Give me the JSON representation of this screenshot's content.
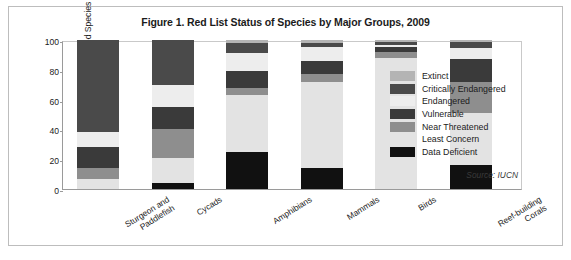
{
  "figure": {
    "title": "Figure 1. Red List Status of Species by Major Groups, 2009",
    "source": "Source: IUCN"
  },
  "axes": {
    "ylabel": "Percent of Evaluated Species",
    "yticks": [
      "100",
      "80",
      "60",
      "40",
      "20",
      "0"
    ]
  },
  "legend": {
    "items": [
      {
        "label": "Extinct",
        "color": "#b4b4b4"
      },
      {
        "label": "Critically Endangered",
        "color": "#4a4a4a"
      },
      {
        "label": "Endangered",
        "color": "#ededed"
      },
      {
        "label": "Vulnerable",
        "color": "#3a3a3a"
      },
      {
        "label": "Near Threatened",
        "color": "#8e8e8e"
      },
      {
        "label": "Least Concern",
        "color": "#e3e3e3"
      },
      {
        "label": "Data Deficient",
        "color": "#111111"
      }
    ]
  },
  "chart_data": {
    "type": "bar",
    "subtype": "stacked-bar-100-percent",
    "title": "Figure 1. Red List Status of Species by Major Groups, 2009",
    "xlabel": "",
    "ylabel": "Percent of Evaluated Species",
    "ylim": [
      0,
      100
    ],
    "ytick_step": 20,
    "grid": false,
    "legend_position": "right",
    "source": "Source: IUCN",
    "categories": [
      "Sturgeon and Paddlefish",
      "Cycads",
      "Amphibians",
      "Mammals",
      "Birds",
      "Reef-building Corals"
    ],
    "category_lines": [
      [
        "Sturgeon and",
        "Paddlefish"
      ],
      [
        "Cycads"
      ],
      [
        "Amphibians"
      ],
      [
        "Mammals"
      ],
      [
        "Birds"
      ],
      [
        "Reef-building",
        "Corals"
      ]
    ],
    "series": [
      {
        "name": "Data Deficient",
        "color": "#111111",
        "values": [
          0,
          4,
          25,
          14,
          0,
          16
        ]
      },
      {
        "name": "Least Concern",
        "color": "#e3e3e3",
        "values": [
          7,
          17,
          38,
          58,
          88,
          35
        ]
      },
      {
        "name": "Near Threatened",
        "color": "#8e8e8e",
        "values": [
          7,
          19,
          5,
          5,
          4,
          21
        ]
      },
      {
        "name": "Vulnerable",
        "color": "#3a3a3a",
        "values": [
          14,
          15,
          11,
          9,
          3,
          15
        ]
      },
      {
        "name": "Endangered",
        "color": "#ededed",
        "values": [
          10,
          15,
          12,
          9,
          2,
          8
        ]
      },
      {
        "name": "Critically Endangered",
        "color": "#4a4a4a",
        "values": [
          62,
          30,
          7,
          3,
          2,
          4
        ]
      },
      {
        "name": "Extinct",
        "color": "#b4b4b4",
        "values": [
          0,
          0,
          2,
          2,
          1,
          1
        ]
      }
    ]
  }
}
